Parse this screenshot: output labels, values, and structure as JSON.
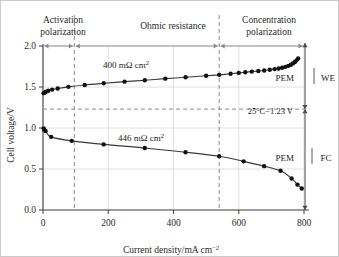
{
  "chart_data": {
    "type": "line",
    "title": "",
    "xlabel": "Current density/mA cm−2",
    "ylabel": "Cell voltage/V",
    "xlim": [
      0,
      800
    ],
    "ylim": [
      0.0,
      2.0
    ],
    "xticks": [
      0,
      200,
      400,
      600,
      800
    ],
    "xtick_labels": [
      "0",
      "200",
      "400",
      "600",
      "800"
    ],
    "yticks": [
      0.0,
      0.5,
      1.0,
      1.5,
      2.0
    ],
    "ytick_labels": [
      "0.0",
      "0.5",
      "1.0",
      "1.5",
      "2.0"
    ],
    "grid": true,
    "legend_position": "none",
    "series": [
      {
        "name": "PEM WE",
        "label": "400 mΩ cm",
        "label_sup": "2",
        "resistance_value": 400,
        "resistance_unit": "mΩ cm²",
        "side_label": "PEM",
        "side_label_2": "WE",
        "x": [
          2,
          5,
          9,
          16,
          28,
          45,
          78,
          128,
          186,
          250,
          312,
          375,
          437,
          500,
          540,
          575,
          600,
          620,
          640,
          660,
          678,
          695,
          710,
          722,
          733,
          743,
          752,
          760,
          766,
          772,
          777,
          782
        ],
        "y": [
          1.425,
          1.432,
          1.442,
          1.455,
          1.468,
          1.482,
          1.502,
          1.525,
          1.545,
          1.565,
          1.583,
          1.602,
          1.618,
          1.637,
          1.648,
          1.662,
          1.672,
          1.68,
          1.688,
          1.695,
          1.702,
          1.71,
          1.718,
          1.726,
          1.735,
          1.746,
          1.758,
          1.772,
          1.788,
          1.805,
          1.825,
          1.848
        ]
      },
      {
        "name": "PEM FC",
        "label": "446 mΩ cm",
        "label_sup": "2",
        "resistance_value": 446,
        "resistance_unit": "mΩ cm²",
        "side_label": "PEM",
        "side_label_2": "FC",
        "x": [
          2,
          4,
          8,
          25,
          88,
          186,
          312,
          437,
          540,
          615,
          678,
          728,
          762,
          780,
          793
        ],
        "y": [
          0.995,
          0.98,
          0.962,
          0.892,
          0.843,
          0.8,
          0.757,
          0.705,
          0.655,
          0.593,
          0.535,
          0.478,
          0.385,
          0.31,
          0.262
        ]
      }
    ],
    "regions": [
      {
        "label": "Activation polarization",
        "line1": "Activation",
        "line2": "polarization",
        "x_start": 0,
        "x_end": 96
      },
      {
        "label": "Ohmic resistance",
        "line1": "Ohmic resistance",
        "line2": "",
        "x_start": 96,
        "x_end": 540
      },
      {
        "label": "Concentration polarization",
        "line1": "Concentration",
        "line2": "polarization",
        "x_start": 540,
        "x_end": 800
      }
    ],
    "annotations": [
      {
        "text": "25°C−1.23 V",
        "y_value": 1.23,
        "note": "equilibrium cell voltage reference line"
      }
    ],
    "dividers": [
      96,
      540
    ],
    "colors": {
      "curve": "#3a3a3a",
      "marker": "#111111",
      "grid": "#d8d8d8",
      "axis": "#4a4a4a",
      "divider": "#8a8a8a",
      "frame": "#c9c9c9"
    }
  }
}
